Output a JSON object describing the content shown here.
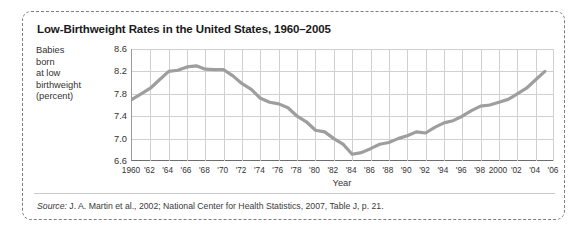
{
  "figure": {
    "title": "Low-Birthweight Rates in the United States, 1960–2005",
    "source_label": "Source:",
    "source_text": " J. A. Martin et al., 2002; National Center for Health Statistics, 2007, Table J, p. 21.",
    "y_caption_lines": [
      "Babies",
      "born",
      "at low",
      "birthweight",
      "(percent)"
    ],
    "line_color": "#9e9e9e",
    "grid_color": "#d0d0d0",
    "axis_color": "#6d6d6d",
    "border_color": "#7c7c7c"
  },
  "chart_data": {
    "type": "line",
    "title": "Low-Birthweight Rates in the United States, 1960–2005",
    "xlabel": "Year",
    "ylabel": "Babies born at low birthweight (percent)",
    "xlim": [
      1960,
      2006
    ],
    "ylim": [
      6.6,
      8.6
    ],
    "yticks": [
      6.6,
      7.0,
      7.4,
      7.8,
      8.2,
      8.6
    ],
    "ytick_labels": [
      "6.6",
      "7.0",
      "7.4",
      "7.8",
      "8.2",
      "8.6"
    ],
    "xticks": [
      1960,
      1962,
      1964,
      1966,
      1968,
      1970,
      1972,
      1974,
      1976,
      1978,
      1980,
      1982,
      1984,
      1986,
      1988,
      1990,
      1992,
      1994,
      1996,
      1998,
      2000,
      2002,
      2004,
      2006
    ],
    "xtick_labels": [
      "1960",
      "'62",
      "'64",
      "'66",
      "'68",
      "'70",
      "'72",
      "'74",
      "'76",
      "'78",
      "'80",
      "'82",
      "'84",
      "'86",
      "'88",
      "'90",
      "'92",
      "'94",
      "'96",
      "'98",
      "2000",
      "'02",
      "'04",
      "'06"
    ],
    "grid": true,
    "legend": null,
    "series": [
      {
        "name": "Low-birthweight rate",
        "color": "#9e9e9e",
        "x": [
          1960,
          1961,
          1962,
          1963,
          1964,
          1965,
          1966,
          1967,
          1968,
          1969,
          1970,
          1971,
          1972,
          1973,
          1974,
          1975,
          1976,
          1977,
          1978,
          1979,
          1980,
          1981,
          1982,
          1983,
          1984,
          1985,
          1986,
          1987,
          1988,
          1989,
          1990,
          1991,
          1992,
          1993,
          1994,
          1995,
          1996,
          1997,
          1998,
          1999,
          2000,
          2001,
          2002,
          2003,
          2004,
          2005
        ],
        "values": [
          7.7,
          7.8,
          7.9,
          8.05,
          8.2,
          8.22,
          8.28,
          8.3,
          8.24,
          8.23,
          8.23,
          8.12,
          7.98,
          7.88,
          7.72,
          7.65,
          7.62,
          7.55,
          7.4,
          7.3,
          7.15,
          7.12,
          7.0,
          6.9,
          6.72,
          6.75,
          6.82,
          6.9,
          6.93,
          7.0,
          7.05,
          7.12,
          7.1,
          7.2,
          7.28,
          7.32,
          7.4,
          7.5,
          7.58,
          7.6,
          7.65,
          7.7,
          7.8,
          7.9,
          8.05,
          8.2
        ]
      }
    ]
  }
}
